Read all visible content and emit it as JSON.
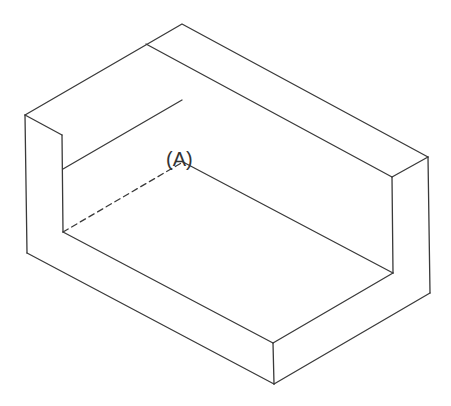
{
  "diagram": {
    "type": "isometric-block",
    "label_A": "(A)",
    "stroke_color": "#3a3a3a",
    "background": "#ffffff"
  }
}
